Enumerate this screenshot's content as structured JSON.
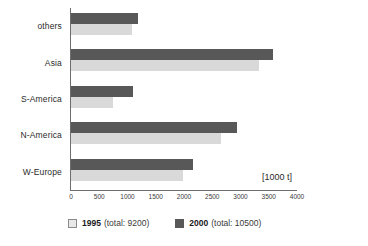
{
  "chart_data": {
    "type": "bar",
    "orientation": "horizontal",
    "title": "",
    "subtitle": "",
    "xlabel": "[1000 t]",
    "ylabel": "",
    "xlim": [
      0,
      4000
    ],
    "xticks": [
      0,
      500,
      1000,
      1500,
      2000,
      2500,
      3000,
      3500,
      4000
    ],
    "xtick_labels": [
      "0",
      "500",
      "1000",
      "1500",
      "2000",
      "2500",
      "3000",
      "3500",
      "4000"
    ],
    "grid": false,
    "legend_position": "bottom-left",
    "categories": [
      "others",
      "Asia",
      "S-America",
      "N-America",
      "W-Europe"
    ],
    "series": [
      {
        "name": "1995",
        "total": 9200,
        "legend_label": "1995",
        "legend_total": "(total: 9200)",
        "color": "#d9d9d9",
        "values": [
          1080,
          3320,
          750,
          2650,
          1990
        ]
      },
      {
        "name": "2000",
        "total": 10500,
        "legend_label": "2000",
        "legend_total": "(total: 10500)",
        "color": "#585858",
        "values": [
          1180,
          3570,
          1100,
          2930,
          2160
        ]
      }
    ]
  },
  "axis": {
    "unit_label": "[1000 t]"
  },
  "legend": {
    "items": [
      {
        "label": "1995",
        "total": "(total: 9200)",
        "swatch": "light-square-swatch"
      },
      {
        "label": "2000",
        "total": "(total: 10500)",
        "swatch": "dark-square-swatch"
      }
    ]
  }
}
